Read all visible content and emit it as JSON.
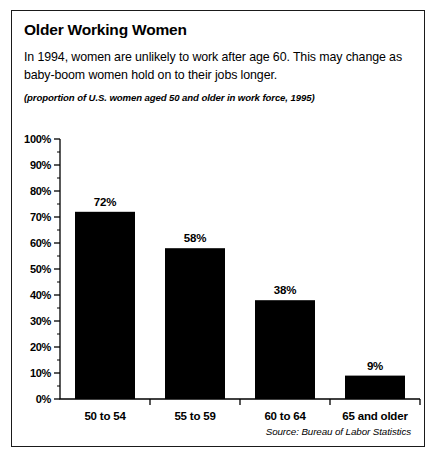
{
  "panel": {
    "title": "Older Working Women",
    "lede": "In 1994, women are unlikely to work after age 60. This may change as baby-boom women hold on to their jobs longer.",
    "subnote": "(proportion of U.S. women aged 50 and older in work force, 1995)",
    "source": "Source: Bureau of Labor Statistics"
  },
  "chart_data": {
    "type": "bar",
    "title": "Older Working Women",
    "subtitle": "(proportion of U.S. women aged 50 and older in work force, 1995)",
    "categories": [
      "50 to 54",
      "55 to 59",
      "60 to 64",
      "65 and older"
    ],
    "values": [
      72,
      58,
      38,
      9
    ],
    "value_labels": [
      "72%",
      "58%",
      "38%",
      "9%"
    ],
    "xlabel": "",
    "ylabel": "",
    "ylim": [
      0,
      100
    ],
    "y_tick_labels": [
      "100%",
      "90%",
      "80%",
      "70%",
      "60%",
      "50%",
      "40%",
      "30%",
      "20%",
      "10%",
      "0%"
    ],
    "y_tick_values": [
      100,
      90,
      80,
      70,
      60,
      50,
      40,
      30,
      20,
      10,
      0
    ],
    "y_minor_step": 5,
    "grid": false,
    "legend": "none",
    "bar_color": "#000000",
    "source": "Source: Bureau of Labor Statistics"
  }
}
